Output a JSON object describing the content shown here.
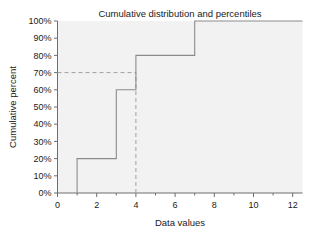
{
  "chart_data": {
    "type": "line",
    "subtype": "step-ecdf",
    "title": "Cumulative distribution and percentiles",
    "xlabel": "Data values",
    "ylabel": "Cumulative percent",
    "xlim": [
      0,
      12.5
    ],
    "ylim": [
      0,
      100
    ],
    "grid": false,
    "legend": "none",
    "background_color": "#f2f2f2",
    "line_color": "#8c8c8c",
    "reference_line_color": "#a0a0a0",
    "axis_color": "#6e6e6e",
    "xticks": [
      0,
      2,
      4,
      6,
      8,
      10,
      12
    ],
    "xtick_labels": [
      "0",
      "2",
      "4",
      "6",
      "8",
      "10",
      "12"
    ],
    "xticks_minor": [
      1,
      3,
      5,
      7,
      9,
      11
    ],
    "yticks": [
      0,
      10,
      20,
      30,
      40,
      50,
      60,
      70,
      80,
      90,
      100
    ],
    "ytick_labels": [
      "0%",
      "10%",
      "20%",
      "30%",
      "40%",
      "50%",
      "60%",
      "70%",
      "80%",
      "90%",
      "100%"
    ],
    "series": [
      {
        "name": "Cumulative distribution",
        "step_points": [
          {
            "x": 1,
            "y": 0
          },
          {
            "x": 1,
            "y": 20
          },
          {
            "x": 3,
            "y": 20
          },
          {
            "x": 3,
            "y": 60
          },
          {
            "x": 4,
            "y": 60
          },
          {
            "x": 4,
            "y": 80
          },
          {
            "x": 7,
            "y": 80
          },
          {
            "x": 7,
            "y": 100
          },
          {
            "x": 12.5,
            "y": 100
          }
        ]
      }
    ],
    "reference_lines": [
      {
        "name": "percentile-horizontal",
        "orientation": "horizontal",
        "value": 70,
        "from_x": 0,
        "to_x": 4,
        "style": "dashed"
      },
      {
        "name": "percentile-vertical",
        "orientation": "vertical",
        "value": 4,
        "from_y": 0,
        "to_y": 70,
        "style": "dashed"
      }
    ],
    "annotations": []
  }
}
